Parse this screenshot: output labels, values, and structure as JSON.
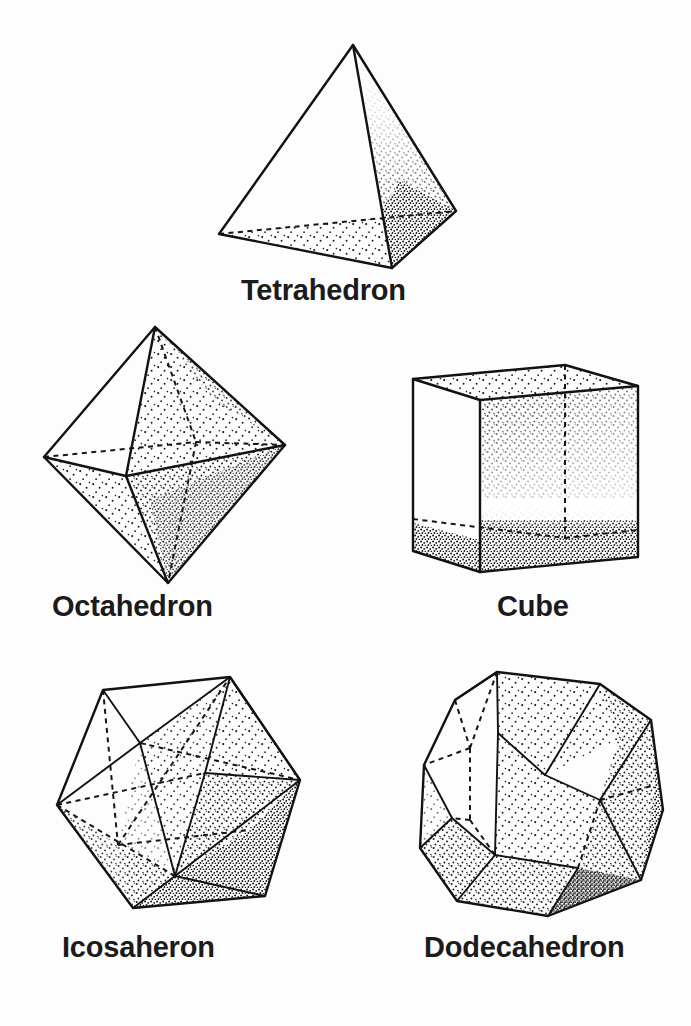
{
  "figure": {
    "background_color": "#fdfdfd",
    "ink_color": "#121212",
    "style": "line drawing with stipple shading",
    "width": 691,
    "height": 1026
  },
  "solids": [
    {
      "id": "tetrahedron",
      "label": "Tetrahedron",
      "faces": 4,
      "face_shape": "triangle",
      "shading": "stippled right face and bottom face",
      "hidden_edges": 1
    },
    {
      "id": "octahedron",
      "label": "Octahedron",
      "faces": 8,
      "face_shape": "triangle",
      "shading": "stippled right and lower faces",
      "hidden_edges": 3
    },
    {
      "id": "cube",
      "label": "Cube",
      "faces": 6,
      "face_shape": "square",
      "shading": "stippled front face, top band and bottom band",
      "hidden_edges": 3
    },
    {
      "id": "icosahedron",
      "label": "Icosaheron",
      "faces": 20,
      "face_shape": "triangle",
      "shading": "stippled right and lower faces",
      "hidden_edges": 6
    },
    {
      "id": "dodecahedron",
      "label": "Dodecahedron",
      "faces": 12,
      "face_shape": "pentagon",
      "shading": "stippled front, right and lower faces",
      "hidden_edges": 5
    }
  ],
  "layout": {
    "row1": [
      "tetrahedron"
    ],
    "row2": [
      "octahedron",
      "cube"
    ],
    "row3": [
      "icosahedron",
      "dodecahedron"
    ]
  }
}
